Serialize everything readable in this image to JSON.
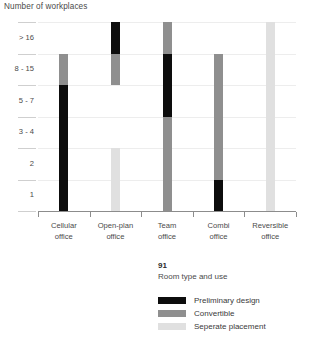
{
  "chart_data": {
    "type": "bar",
    "title": "Number of workplaces",
    "ylabel": "Number of workplaces",
    "xlabel": "Room type and use",
    "orientation": "vertical-range",
    "grid": true,
    "legend_position": "bottom-center",
    "y_categories": [
      "1",
      "2",
      "3 - 4",
      "5 - 7",
      "8 - 15",
      "> 16"
    ],
    "y_categories_top_down": [
      "> 16",
      "8 - 15",
      "5 - 7",
      "3 - 4",
      "2",
      "1"
    ],
    "categories": [
      "Cellular office",
      "Open-plan office",
      "Team office",
      "Combi office",
      "Reversible office"
    ],
    "series": [
      {
        "name": "Preliminary design",
        "color": "#0d0d0d"
      },
      {
        "name": "Convertible",
        "color": "#8f8f8f"
      },
      {
        "name": "Seperate placement",
        "color": "#e0e0e0"
      }
    ],
    "bars": [
      {
        "category": "Cellular office",
        "segments": [
          {
            "series": "Convertible",
            "from": "3 - 4 top",
            "to": "8 - 15 top",
            "y_from": 4,
            "y_to": 5
          },
          {
            "series": "Preliminary design",
            "from": "baseline",
            "to": "3 - 4 top",
            "y_from": 0,
            "y_to": 4
          }
        ]
      },
      {
        "category": "Open-plan office",
        "segments": [
          {
            "series": "Preliminary design",
            "from": "8 - 15 top",
            "to": "> 16 top",
            "y_from": 5,
            "y_to": 6
          },
          {
            "series": "Convertible",
            "from": "5 - 7 top",
            "to": "8 - 15 top",
            "y_from": 4,
            "y_to": 5
          },
          {
            "series": "Seperate placement",
            "from": "baseline",
            "to": "2 top",
            "y_from": 0,
            "y_to": 2
          }
        ]
      },
      {
        "category": "Team office",
        "segments": [
          {
            "series": "Convertible",
            "from": "8 - 15 top",
            "to": "> 16 top",
            "y_from": 5,
            "y_to": 6
          },
          {
            "series": "Preliminary design",
            "from": "5 - 7 bottom",
            "to": "8 - 15 top",
            "y_from": 3,
            "y_to": 5
          },
          {
            "series": "Convertible",
            "from": "baseline",
            "to": "5 - 7 bottom",
            "y_from": 0,
            "y_to": 3
          }
        ]
      },
      {
        "category": "Combi office",
        "segments": [
          {
            "series": "Convertible",
            "from": "1 top",
            "to": "8 - 15 top",
            "y_from": 1,
            "y_to": 5
          },
          {
            "series": "Preliminary design",
            "from": "baseline",
            "to": "1 top",
            "y_from": 0,
            "y_to": 1
          }
        ]
      },
      {
        "category": "Reversible office",
        "segments": [
          {
            "series": "Seperate placement",
            "from": "baseline",
            "to": "> 16 top",
            "y_from": 0,
            "y_to": 6
          }
        ]
      }
    ]
  },
  "chart": {
    "axis_title": "Number of workplaces",
    "y_labels": [
      "> 16",
      "8 - 15",
      "5 - 7",
      "3 - 4",
      "2",
      "1"
    ],
    "x_labels": [
      {
        "line1": "Cellular",
        "line2": "office"
      },
      {
        "line1": "Open-plan",
        "line2": "office"
      },
      {
        "line1": "Team",
        "line2": "office"
      },
      {
        "line1": "Combi",
        "line2": "office"
      },
      {
        "line1": "Reversible",
        "line2": "office"
      }
    ]
  },
  "caption": {
    "number": "91",
    "text": "Room type and use"
  },
  "legend": {
    "items": [
      {
        "label": "Preliminary design",
        "color": "#0d0d0d"
      },
      {
        "label": "Convertible",
        "color": "#8f8f8f"
      },
      {
        "label": "Seperate placement",
        "color": "#e0e0e0"
      }
    ]
  },
  "colors": {
    "preliminary_design": "#0d0d0d",
    "convertible": "#8f8f8f",
    "seperate_placement": "#e0e0e0",
    "grid": "#ededed",
    "axis": "#8c8c8c",
    "text": "#3a3a3a"
  }
}
